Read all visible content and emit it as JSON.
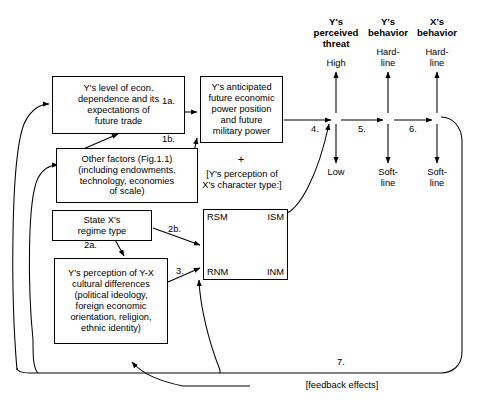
{
  "diagram": {
    "boxes": {
      "econ_dependence": "Y's level of econ.\ndependence and its\nexpectations of\nfuture trade",
      "other_factors": "Other factors (Fig.1.1)\n(including endowments,\ntechnology, economies\nof scale)",
      "regime_type": "State X's\nregime type",
      "cultural_differences": "Y's perception of Y-X\ncultural differences\n(political ideology,\nforeign economic\norientation, religion,\nethnic identity)",
      "anticipated_power": "Y's anticipated\nfuture economic\npower position\nand future\nmilitary power"
    },
    "plus_sign": "+",
    "character_type_label": "[Y's perception of\nX's character type:]",
    "matrix": {
      "top_left": "RSM",
      "top_right": "ISM",
      "bottom_left": "RNM",
      "bottom_right": "INM"
    },
    "columns": [
      {
        "header": "Y's\nperceived\nthreat",
        "top_value": "High",
        "bottom_value": "Low"
      },
      {
        "header": "Y's\nbehavior",
        "top_value": "Hard-\nline",
        "bottom_value": "Soft-\nline"
      },
      {
        "header": "X's\nbehavior",
        "top_value": "Hard-\nline",
        "bottom_value": "Soft-\nline"
      }
    ],
    "arrow_labels": {
      "a1": "1a.",
      "b1": "1b.",
      "a2": "2a.",
      "b2": "2b.",
      "n3": "3.",
      "n4": "4.",
      "n5": "5.",
      "n6": "6.",
      "n7": "7."
    },
    "feedback_caption": "[feedback effects]",
    "colors": {
      "line": "#000000",
      "text": "#000000",
      "background": "#ffffff"
    }
  }
}
